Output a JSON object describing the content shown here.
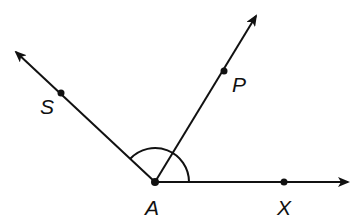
{
  "diagram": {
    "type": "geometry-angles",
    "vertex": {
      "label": "A",
      "x": 155,
      "y": 182
    },
    "rays": [
      {
        "name": "ray-AS",
        "through": "S",
        "end": {
          "x": 14,
          "y": 50
        }
      },
      {
        "name": "ray-AP",
        "through": "P",
        "end": {
          "x": 257,
          "y": 14
        }
      },
      {
        "name": "ray-AX",
        "through": "X",
        "end": {
          "x": 350,
          "y": 182
        }
      }
    ],
    "points": [
      {
        "label": "S",
        "x": 61,
        "y": 93,
        "label_x": 40,
        "label_y": 114
      },
      {
        "label": "P",
        "x": 224,
        "y": 71,
        "label_x": 232,
        "label_y": 92
      },
      {
        "label": "X",
        "x": 284,
        "y": 182,
        "label_x": 277,
        "label_y": 215
      }
    ],
    "vertex_label": {
      "text": "A",
      "x": 145,
      "y": 215
    },
    "angle_arc": {
      "description": "Arc marking angle SAX",
      "radius": 34
    },
    "color": "#111111"
  }
}
